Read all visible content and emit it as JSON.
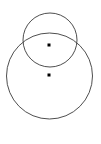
{
  "figure": {
    "background_color": "#ffffff",
    "width": 101,
    "height": 144,
    "stroke_color": "#3a3a3a",
    "point_color": "#000000"
  },
  "chart_data": {
    "type": "scatter",
    "subtitle": "",
    "xlabel": "",
    "ylabel": "",
    "xlim": [
      0,
      101
    ],
    "ylim": [
      0,
      144
    ],
    "grid": false,
    "legend": "none",
    "axes_visible": false,
    "tick_labels_x": [],
    "tick_labels_y": [],
    "annotations": [],
    "shapes": [
      {
        "name": "large-circle",
        "type": "circle",
        "cx": 49.5,
        "cy": 76.0,
        "r": 43.0,
        "stroke": "#3a3a3a",
        "stroke_width": 0.9,
        "fill": "none"
      },
      {
        "name": "small-circle",
        "type": "circle",
        "cx": 50.0,
        "cy": 40.0,
        "r": 27.0,
        "stroke": "#3a3a3a",
        "stroke_width": 0.9,
        "fill": "none"
      }
    ],
    "series": [
      {
        "name": "centers",
        "marker": "square",
        "marker_size": 3,
        "color": "#000000",
        "points": [
          {
            "label": "small-circle-center",
            "x": 49.0,
            "y": 45.0
          },
          {
            "label": "large-circle-center",
            "x": 49.0,
            "y": 75.0
          }
        ]
      }
    ]
  }
}
